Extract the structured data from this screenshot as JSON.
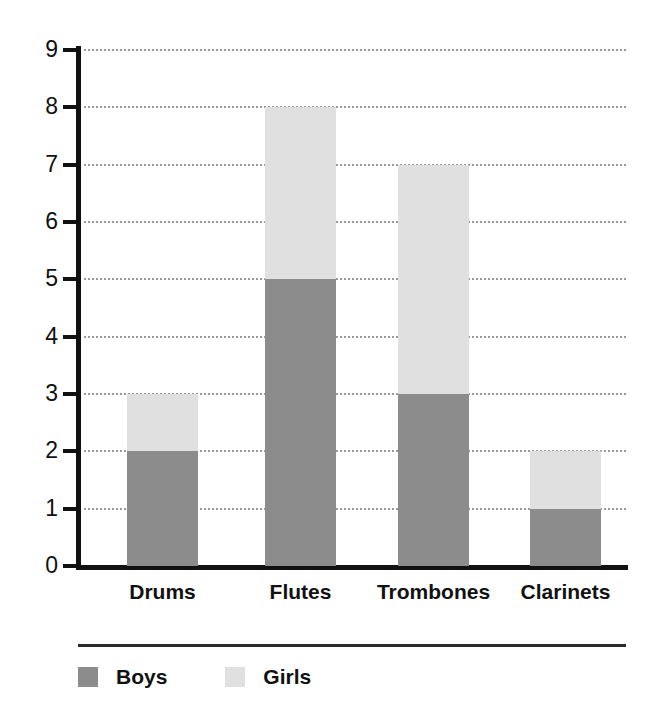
{
  "chart_data": {
    "type": "bar",
    "stacked": true,
    "title": "",
    "subtitle": "",
    "xlabel": "",
    "ylabel": "",
    "categories": [
      "Drums",
      "Flutes",
      "Trombones",
      "Clarinets"
    ],
    "series": [
      {
        "name": "Boys",
        "values": [
          2,
          5,
          3,
          1
        ],
        "color": "#8c8c8c"
      },
      {
        "name": "Girls",
        "values": [
          1,
          3,
          4,
          1
        ],
        "color": "#e0e0e0"
      }
    ],
    "totals": [
      3,
      8,
      7,
      2
    ],
    "ylim": [
      0,
      9
    ],
    "ytick_labels": [
      "0",
      "1",
      "2",
      "3",
      "4",
      "5",
      "6",
      "7",
      "8",
      "9"
    ],
    "ytick_values": [
      0,
      1,
      2,
      3,
      4,
      5,
      6,
      7,
      8,
      9
    ],
    "grid": true,
    "grid_style": "dotted",
    "grid_color": "#9a9a9a",
    "legend_position": "bottom-left",
    "axis_color": "#111111",
    "background_color": "#ffffff"
  },
  "legend": {
    "entries": [
      {
        "label": "Boys",
        "color": "#8c8c8c"
      },
      {
        "label": "Girls",
        "color": "#e0e0e0"
      }
    ]
  }
}
